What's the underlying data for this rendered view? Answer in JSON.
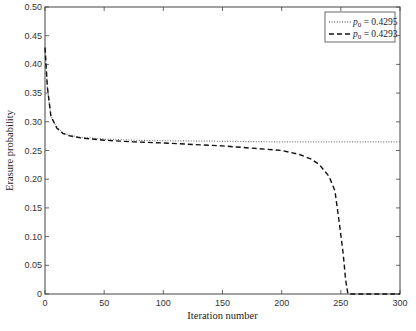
{
  "chart_data": {
    "type": "line",
    "title": "",
    "xlabel": "Iteration number",
    "ylabel": "Erasure probability",
    "xlim": [
      0,
      300
    ],
    "ylim": [
      0,
      0.5
    ],
    "xticks": [
      "0",
      "50",
      "100",
      "150",
      "200",
      "250",
      "300"
    ],
    "yticks": [
      "0",
      "0.05",
      "0.10",
      "0.15",
      "0.20",
      "0.25",
      "0.30",
      "0.35",
      "0.40",
      "0.45",
      "0.50"
    ],
    "grid": false,
    "legend_position": "upper right",
    "series": [
      {
        "name": "p0 = 0.4295",
        "style": "dotted",
        "x": [
          0,
          2,
          5,
          10,
          15,
          20,
          30,
          50,
          75,
          100,
          150,
          200,
          250,
          300
        ],
        "y": [
          0.4295,
          0.36,
          0.31,
          0.29,
          0.281,
          0.277,
          0.273,
          0.27,
          0.268,
          0.267,
          0.266,
          0.265,
          0.265,
          0.265
        ]
      },
      {
        "name": "p0 = 0.4293",
        "style": "dashed",
        "x": [
          0,
          2,
          5,
          10,
          15,
          20,
          30,
          50,
          75,
          100,
          150,
          200,
          215,
          225,
          232,
          240,
          245,
          249,
          252,
          254,
          256,
          258,
          300
        ],
        "y": [
          0.4293,
          0.36,
          0.31,
          0.289,
          0.28,
          0.276,
          0.272,
          0.268,
          0.265,
          0.263,
          0.258,
          0.25,
          0.243,
          0.235,
          0.225,
          0.205,
          0.18,
          0.12,
          0.07,
          0.025,
          0.0,
          0.0,
          0.0
        ]
      }
    ]
  },
  "legend": {
    "items": [
      {
        "symbol": "p",
        "sub": "0",
        "value": " = 0.4295",
        "style": "dotted"
      },
      {
        "symbol": "p",
        "sub": "0",
        "value": " = 0.4293",
        "style": "dashed"
      }
    ]
  }
}
